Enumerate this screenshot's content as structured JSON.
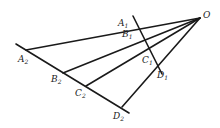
{
  "diagram": {
    "vertex": {
      "label": "O",
      "x": 200,
      "y": 18
    },
    "rays": [
      {
        "name": "OA",
        "end": {
          "x": 26,
          "y": 50
        }
      },
      {
        "name": "OB",
        "end": {
          "x": 63,
          "y": 73
        }
      },
      {
        "name": "OC",
        "end": {
          "x": 86,
          "y": 86
        }
      },
      {
        "name": "OD",
        "end": {
          "x": 122,
          "y": 107
        }
      }
    ],
    "transversals": [
      {
        "name": "line-1",
        "from": {
          "x": 133,
          "y": 16
        },
        "to": {
          "x": 162,
          "y": 74
        }
      },
      {
        "name": "line-2",
        "from": {
          "x": 16,
          "y": 44
        },
        "to": {
          "x": 129,
          "y": 113
        }
      }
    ],
    "points": [
      {
        "id": "A1",
        "base": "A",
        "sub": "1"
      },
      {
        "id": "B1",
        "base": "B",
        "sub": "1"
      },
      {
        "id": "C1",
        "base": "C",
        "sub": "1"
      },
      {
        "id": "D1",
        "base": "D",
        "sub": "1"
      },
      {
        "id": "A2",
        "base": "A",
        "sub": "2"
      },
      {
        "id": "B2",
        "base": "B",
        "sub": "2"
      },
      {
        "id": "C2",
        "base": "C",
        "sub": "2"
      },
      {
        "id": "D2",
        "base": "D",
        "sub": "2"
      }
    ],
    "labels": {
      "O": "O",
      "A1": "A",
      "A1_sub": "1",
      "B1": "B",
      "B1_sub": "1",
      "C1": "C",
      "C1_sub": "1",
      "D1": "D",
      "D1_sub": "1",
      "A2": "A",
      "A2_sub": "2",
      "B2": "B",
      "B2_sub": "2",
      "C2": "C",
      "C2_sub": "2",
      "D2": "D",
      "D2_sub": "2"
    },
    "stroke_color": "#1a1a1a",
    "background": "#ffffff"
  }
}
